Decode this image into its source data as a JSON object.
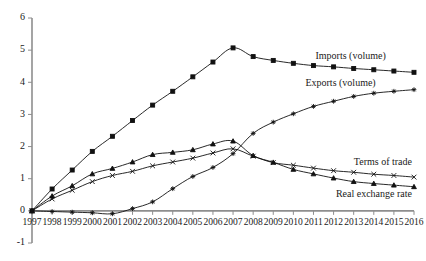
{
  "chart_data": {
    "type": "line",
    "title": "",
    "subtitle": "",
    "xlabel": "",
    "ylabel": "",
    "grid": false,
    "legend_position": "inline-annotations",
    "x": [
      1997,
      1998,
      1999,
      2000,
      2001,
      2002,
      2003,
      2004,
      2005,
      2006,
      2007,
      2008,
      2009,
      2010,
      2011,
      2012,
      2013,
      2014,
      2015,
      2016
    ],
    "xtick_labels": [
      "1997",
      "1998",
      "1999",
      "2000",
      "2001",
      "2002",
      "2003",
      "2004",
      "2005",
      "2006",
      "2007",
      "2008",
      "2009",
      "2010",
      "2011",
      "2012",
      "2013",
      "2014",
      "2015",
      "2016"
    ],
    "ytick_labels": [
      "-1",
      "0",
      "1",
      "2",
      "3",
      "4",
      "5",
      "6"
    ],
    "yticks": [
      -1,
      0,
      1,
      2,
      3,
      4,
      5,
      6
    ],
    "xlim": [
      1997,
      2016
    ],
    "ylim": [
      -1,
      6
    ],
    "series": [
      {
        "name": "Imports (volume)",
        "marker": "square",
        "label_x": 2011.1,
        "label_y": 4.72,
        "label_anchor": "start",
        "values": [
          0.0,
          0.68,
          1.27,
          1.85,
          2.32,
          2.81,
          3.29,
          3.72,
          4.17,
          4.63,
          5.07,
          4.8,
          4.68,
          4.59,
          4.52,
          4.48,
          4.43,
          4.39,
          4.35,
          4.31
        ]
      },
      {
        "name": "Exports (volume)",
        "marker": "plus",
        "label_x": 2010.6,
        "label_y": 3.87,
        "label_anchor": "start",
        "values": [
          0.0,
          -0.02,
          -0.04,
          -0.06,
          -0.09,
          0.07,
          0.28,
          0.69,
          1.07,
          1.35,
          1.78,
          2.41,
          2.76,
          3.02,
          3.25,
          3.41,
          3.56,
          3.66,
          3.72,
          3.77
        ]
      },
      {
        "name": "Terms of trade",
        "marker": "cross",
        "label_x": 2015.9,
        "label_y": 1.42,
        "label_anchor": "end",
        "values": [
          0.0,
          0.37,
          0.64,
          0.91,
          1.1,
          1.23,
          1.4,
          1.52,
          1.64,
          1.8,
          1.93,
          1.7,
          1.5,
          1.42,
          1.33,
          1.25,
          1.2,
          1.14,
          1.1,
          1.05
        ]
      },
      {
        "name": "Real exchange rate",
        "marker": "triangle",
        "label_x": 2015.9,
        "label_y": 0.42,
        "label_anchor": "end",
        "values": [
          0.0,
          0.46,
          0.78,
          1.15,
          1.32,
          1.52,
          1.75,
          1.82,
          1.9,
          2.08,
          2.17,
          1.72,
          1.51,
          1.29,
          1.15,
          1.02,
          0.91,
          0.85,
          0.8,
          0.75
        ]
      }
    ]
  }
}
